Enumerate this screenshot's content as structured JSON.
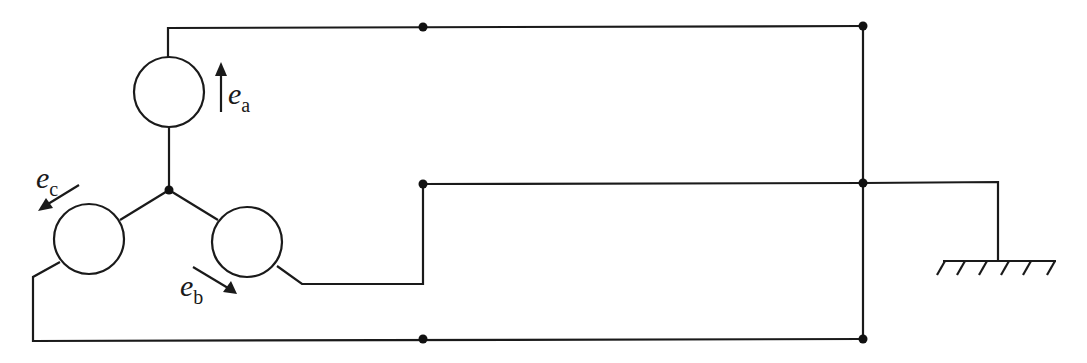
{
  "diagram": {
    "type": "three-phase star-connected generator circuit",
    "generators": [
      {
        "id": "a",
        "emf_symbol": "e",
        "emf_subscript": "a",
        "arrow_direction": "up"
      },
      {
        "id": "b",
        "emf_symbol": "e",
        "emf_subscript": "b",
        "arrow_direction": "down-right"
      },
      {
        "id": "c",
        "emf_symbol": "e",
        "emf_subscript": "c",
        "arrow_direction": "down-left"
      }
    ],
    "neutral_point": "star node",
    "ground_symbol": "earth",
    "colors": {
      "line": "#1a1a1a",
      "background": "#ffffff"
    }
  }
}
